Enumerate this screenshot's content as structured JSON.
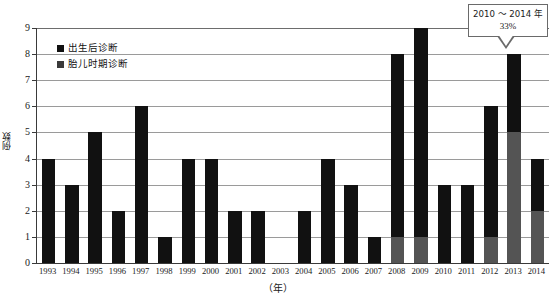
{
  "chart_data": {
    "type": "bar",
    "title": "",
    "subtitle": "",
    "xlabel": "（年）",
    "ylabel": "例数",
    "ylim": [
      0,
      9
    ],
    "ytick_step": 1,
    "grid": true,
    "stacked": true,
    "legend_position": "top-left",
    "categories": [
      "1993",
      "1994",
      "1995",
      "1996",
      "1997",
      "1998",
      "1999",
      "2000",
      "2001",
      "2002",
      "2003",
      "2004",
      "2005",
      "2006",
      "2007",
      "2008",
      "2009",
      "2010",
      "2011",
      "2012",
      "2013",
      "2014"
    ],
    "yticks": [
      "0",
      "1",
      "2",
      "3",
      "4",
      "5",
      "6",
      "7",
      "8",
      "9"
    ],
    "series": [
      {
        "name": "出生后诊断",
        "color": "#111111",
        "values": [
          4,
          3,
          5,
          2,
          6,
          1,
          4,
          4,
          2,
          2,
          0,
          2,
          4,
          3,
          1,
          7,
          8,
          3,
          3,
          5,
          3,
          2
        ]
      },
      {
        "name": "胎儿时期诊断",
        "color": "#545454",
        "values": [
          0,
          0,
          0,
          0,
          0,
          0,
          0,
          0,
          0,
          0,
          0,
          0,
          0,
          0,
          0,
          1,
          1,
          0,
          0,
          1,
          5,
          2
        ]
      }
    ],
    "totals": [
      4,
      3,
      5,
      2,
      6,
      1,
      4,
      4,
      2,
      2,
      0,
      2,
      4,
      3,
      1,
      8,
      9,
      3,
      3,
      6,
      8,
      4
    ],
    "annotations": [
      {
        "name": "callout-2010-2014",
        "line1": "2010 ～ 2014 年",
        "line2": "33%",
        "points_to": "2013"
      }
    ]
  },
  "legend": {
    "items": [
      {
        "label": "出生后诊断"
      },
      {
        "label": "胎儿时期诊断"
      }
    ]
  },
  "callout": {
    "line1": "2010 ～ 2014 年",
    "line2": "33%"
  },
  "axes": {
    "y_title": "例数",
    "x_title": "（年）"
  }
}
